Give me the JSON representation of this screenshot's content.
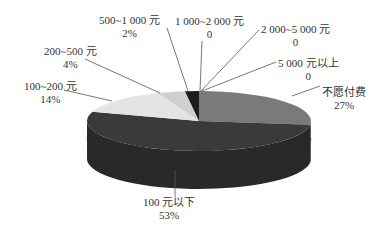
{
  "chart_data": {
    "type": "pie",
    "style": "3d",
    "title": "",
    "categories": [
      "不愿付费",
      "100 元以下",
      "100~200 元",
      "200~500 元",
      "500~1 000 元",
      "1 000~2 000 元",
      "2 000~5 000 元",
      "5 000 元以上"
    ],
    "values": [
      27,
      53,
      14,
      4,
      2,
      0,
      0,
      0
    ],
    "value_labels": [
      "27%",
      "53%",
      "14%",
      "4%",
      "2%",
      "0",
      "0",
      "0"
    ],
    "colors": [
      "#7a7a7a",
      "#3a3a3a",
      "#e4e4e4",
      "#cfcfcf",
      "#1c1c1c",
      "#555555",
      "#555555",
      "#555555"
    ],
    "start_angle_deg": 0,
    "direction": "clockwise",
    "legend": "none"
  },
  "labels": [
    {
      "name": "不愿付费",
      "value": "27%"
    },
    {
      "name": "100 元以下",
      "value": "53%"
    },
    {
      "name": "100~200 元",
      "value": "14%"
    },
    {
      "name": "200~500 元",
      "value": "4%"
    },
    {
      "name": "500~1 000 元",
      "value": "2%"
    },
    {
      "name": "1 000~2 000 元",
      "value": "0"
    },
    {
      "name": "2 000~5 000 元",
      "value": "0"
    },
    {
      "name": "5 000 元以上",
      "value": "0"
    }
  ]
}
